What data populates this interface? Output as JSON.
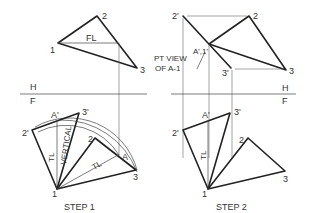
{
  "figure": {
    "step1": {
      "caption": "STEP 1",
      "top_view": {
        "labels": {
          "p1": "1",
          "p2": "2",
          "p3": "3",
          "fl": "FL"
        }
      },
      "fold_line": {
        "upper": "H",
        "lower": "F"
      },
      "front_view": {
        "labels": {
          "p1": "1",
          "p2": "2",
          "p3": "3",
          "p2p": "2'",
          "p3p": "3'",
          "ap": "A'",
          "a": "A",
          "tl1": "TL",
          "tl2": "TL",
          "vertical": "VERTICAL"
        }
      }
    },
    "step2": {
      "caption": "STEP 2",
      "top_view": {
        "labels": {
          "p2p": "2'",
          "p2": "2",
          "p3": "3",
          "p3p": "3'",
          "a1": "A',1'",
          "pt_view_line1": "PT VIEW",
          "pt_view_line2": "OF A-1"
        }
      },
      "fold_line": {
        "upper": "H",
        "lower": "F"
      },
      "front_view": {
        "labels": {
          "p1": "1",
          "p2": "2",
          "p3": "3",
          "p2p": "2'",
          "p3p": "3'",
          "ap": "A'",
          "tl": "TL"
        }
      }
    }
  }
}
